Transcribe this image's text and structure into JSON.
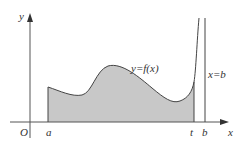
{
  "diagram": {
    "type": "definite-integral-area",
    "labels": {
      "y_axis": "y",
      "x_axis": "x",
      "origin": "O",
      "a": "a",
      "t": "t",
      "b": "b",
      "curve": "y=f(x)",
      "vertical_line": "x=b"
    },
    "colors": {
      "axis": "#555555",
      "curve": "#444444",
      "fill": "#c8c8c8",
      "text": "#333333"
    },
    "shaded_region": {
      "from": "a",
      "to": "t"
    }
  }
}
